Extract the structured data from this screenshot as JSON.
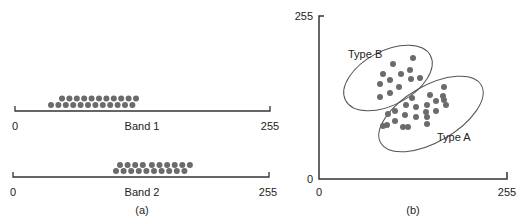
{
  "panel_a": {
    "caption": "(a)",
    "band1": {
      "label": "Band 1",
      "min_label": "0",
      "max_label": "255"
    },
    "band2": {
      "label": "Band 2",
      "min_label": "0",
      "max_label": "255"
    }
  },
  "panel_b": {
    "caption": "(b)",
    "x_min_label": "0",
    "x_max_label": "255",
    "y_min_label": "0",
    "y_max_label": "255",
    "cluster_a_label": "Type A",
    "cluster_b_label": "Type B"
  },
  "colors": {
    "dot": "#6b6b6b",
    "axis": "#333333",
    "ellipse": "#555555"
  },
  "chart_data": [
    {
      "type": "scatter",
      "title": "(a) one-dimensional histograms",
      "series": [
        {
          "name": "Band 1",
          "range": [
            0,
            255
          ],
          "approx_value_range": [
            40,
            125
          ]
        },
        {
          "name": "Band 2",
          "range": [
            0,
            255
          ],
          "approx_value_range": [
            105,
            180
          ]
        }
      ]
    },
    {
      "type": "scatter",
      "title": "(b) two-dimensional feature space",
      "xlim": [
        0,
        255
      ],
      "ylim": [
        0,
        255
      ],
      "series": [
        {
          "name": "Type A",
          "description": "cluster lower-right, elongated ellipse"
        },
        {
          "name": "Type B",
          "description": "cluster upper-left, elongated ellipse"
        }
      ]
    }
  ]
}
